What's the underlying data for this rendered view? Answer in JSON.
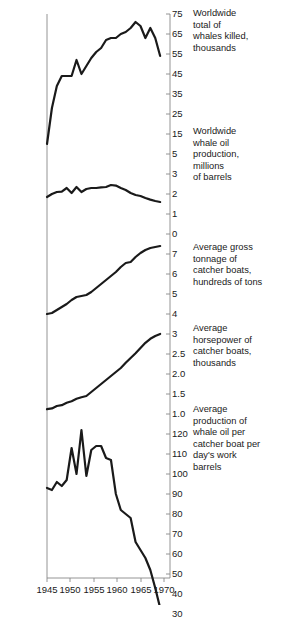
{
  "chart_data": {
    "type": "line",
    "title": "",
    "xlabel": "",
    "ylabel": "",
    "grid": false,
    "legend_position": "right-inline-captions",
    "xlim": [
      1945,
      1970
    ],
    "x_ticks": [
      "1945",
      "1950",
      "1955",
      "1960",
      "1965",
      "1970"
    ],
    "panels": [
      {
        "name": "whales-killed",
        "caption": "Worldwide\ntotal of\nwhales killed,\nthousands",
        "ylabel": "thousands",
        "y_ticks": [
          "75",
          "65",
          "55",
          "45",
          "35",
          "25",
          "15",
          "5"
        ],
        "ylim": [
          5,
          75
        ],
        "x": [
          1945,
          1946,
          1947,
          1948,
          1949,
          1950,
          1951,
          1952,
          1953,
          1954,
          1955,
          1956,
          1957,
          1958,
          1959,
          1960,
          1961,
          1962,
          1963,
          1964,
          1965,
          1966,
          1967,
          1968
        ],
        "values": [
          10,
          28,
          39,
          44,
          44,
          44,
          52,
          45,
          49,
          53,
          56,
          58,
          62,
          63,
          63,
          65,
          66,
          68,
          71,
          69,
          63,
          68,
          63,
          54
        ]
      },
      {
        "name": "whale-oil-production",
        "caption": "Worldwide\nwhale oil\nproduction,\nmillions\nof barrels",
        "ylabel": "millions of barrels",
        "y_ticks": [
          "3",
          "2",
          "1",
          "0"
        ],
        "ylim": [
          0,
          3
        ],
        "x": [
          1945,
          1946,
          1947,
          1948,
          1949,
          1950,
          1951,
          1952,
          1953,
          1954,
          1955,
          1956,
          1957,
          1958,
          1959,
          1960,
          1961,
          1962,
          1963,
          1964,
          1965,
          1966,
          1967,
          1968
        ],
        "values": [
          1.85,
          2.0,
          2.1,
          2.12,
          2.3,
          2.05,
          2.35,
          2.1,
          2.25,
          2.3,
          2.3,
          2.33,
          2.35,
          2.45,
          2.42,
          2.3,
          2.2,
          2.05,
          1.95,
          1.9,
          1.8,
          1.72,
          1.65,
          1.6
        ]
      },
      {
        "name": "gross-tonnage",
        "caption": "Average gross\ntonnage of\ncatcher boats,\nhundreds of tons",
        "ylabel": "hundreds of tons",
        "y_ticks": [
          "7",
          "6",
          "5",
          "4"
        ],
        "ylim": [
          4,
          7.4
        ],
        "x": [
          1945,
          1946,
          1947,
          1948,
          1949,
          1950,
          1951,
          1952,
          1953,
          1954,
          1955,
          1956,
          1957,
          1958,
          1959,
          1960,
          1961,
          1962,
          1963,
          1964,
          1965,
          1966,
          1967,
          1968
        ],
        "values": [
          4.0,
          4.05,
          4.2,
          4.35,
          4.5,
          4.7,
          4.85,
          4.9,
          4.95,
          5.1,
          5.3,
          5.5,
          5.7,
          5.9,
          6.1,
          6.35,
          6.55,
          6.6,
          6.85,
          7.05,
          7.2,
          7.3,
          7.35,
          7.4
        ]
      },
      {
        "name": "horsepower",
        "caption": "Average\nhorsepower of\ncatcher boats,\nthousands",
        "ylabel": "thousands",
        "y_ticks": [
          "3",
          "2.5",
          "2.0",
          "1.5",
          "1.0"
        ],
        "ylim": [
          1.0,
          3.0
        ],
        "x": [
          1945,
          1946,
          1947,
          1948,
          1949,
          1950,
          1951,
          1952,
          1953,
          1954,
          1955,
          1956,
          1957,
          1958,
          1959,
          1960,
          1961,
          1962,
          1963,
          1964,
          1965,
          1966,
          1967,
          1968
        ],
        "values": [
          1.12,
          1.14,
          1.2,
          1.22,
          1.28,
          1.32,
          1.38,
          1.42,
          1.45,
          1.55,
          1.65,
          1.75,
          1.85,
          1.95,
          2.05,
          2.15,
          2.28,
          2.4,
          2.52,
          2.65,
          2.78,
          2.88,
          2.95,
          3.0
        ]
      },
      {
        "name": "production-per-boat-day",
        "caption": "Average\nproduction of\nwhale oil per\ncatcher boat per\nday's work\nbarrels",
        "ylabel": "barrels",
        "y_ticks": [
          "120",
          "110",
          "100",
          "90",
          "80",
          "70",
          "60",
          "50",
          "40",
          "30"
        ],
        "ylim": [
          30,
          125
        ],
        "x": [
          1945,
          1946,
          1947,
          1948,
          1949,
          1950,
          1951,
          1952,
          1953,
          1954,
          1955,
          1956,
          1957,
          1958,
          1959,
          1960,
          1961,
          1962,
          1963,
          1964,
          1965,
          1966,
          1967,
          1968
        ],
        "values": [
          93,
          92,
          96,
          94,
          97,
          113,
          100,
          122,
          99,
          112,
          114,
          114,
          108,
          107,
          90,
          82,
          80,
          78,
          66,
          62,
          58,
          52,
          43,
          33
        ]
      }
    ]
  },
  "axis": {
    "y_tick_labels": [
      {
        "text": "75",
        "y": 14
      },
      {
        "text": "65",
        "y": 34
      },
      {
        "text": "55",
        "y": 54
      },
      {
        "text": "45",
        "y": 74
      },
      {
        "text": "35",
        "y": 94
      },
      {
        "text": "25",
        "y": 114
      },
      {
        "text": "15",
        "y": 134
      },
      {
        "text": "5",
        "y": 154
      },
      {
        "text": "3",
        "y": 174
      },
      {
        "text": "2",
        "y": 194
      },
      {
        "text": "1",
        "y": 214
      },
      {
        "text": "0",
        "y": 234
      },
      {
        "text": "7",
        "y": 254
      },
      {
        "text": "6",
        "y": 274
      },
      {
        "text": "5",
        "y": 294
      },
      {
        "text": "4",
        "y": 314
      },
      {
        "text": "3",
        "y": 334
      },
      {
        "text": "2.5",
        "y": 354
      },
      {
        "text": "2.0",
        "y": 374
      },
      {
        "text": "1.5",
        "y": 394
      },
      {
        "text": "1.0",
        "y": 414
      },
      {
        "text": "120",
        "y": 434
      },
      {
        "text": "110",
        "y": 454
      },
      {
        "text": "100",
        "y": 474
      },
      {
        "text": "90",
        "y": 494
      },
      {
        "text": "80",
        "y": 514
      },
      {
        "text": "70",
        "y": 534
      },
      {
        "text": "60",
        "y": 554
      },
      {
        "text": "50",
        "y": 574
      },
      {
        "text": "40",
        "y": 594
      },
      {
        "text": "30",
        "y": 614
      }
    ],
    "x_tick_labels": [
      {
        "text": "1945",
        "x": 47
      },
      {
        "text": "1950",
        "x": 70
      },
      {
        "text": "1955",
        "x": 94
      },
      {
        "text": "1960",
        "x": 117
      },
      {
        "text": "1965",
        "x": 141
      },
      {
        "text": "1970",
        "x": 164
      }
    ]
  },
  "captions": [
    {
      "name": "caption-whales-killed",
      "text": "Worldwide\ntotal of\nwhales killed,\nthousands",
      "x": 193,
      "y": 8
    },
    {
      "name": "caption-whale-oil",
      "text": "Worldwide\nwhale oil\nproduction,\nmillions\nof barrels",
      "x": 193,
      "y": 126
    },
    {
      "name": "caption-gross-tonnage",
      "text": "Average gross\ntonnage of\ncatcher boats,\nhundreds of tons",
      "x": 193,
      "y": 242
    },
    {
      "name": "caption-horsepower",
      "text": "Average\nhorsepower of\ncatcher boats,\nthousands",
      "x": 193,
      "y": 323
    },
    {
      "name": "caption-production",
      "text": "Average\nproduction of\nwhale oil per\ncatcher boat per\nday's work\nbarrels",
      "x": 193,
      "y": 404
    }
  ],
  "style": {
    "line_color": "#1a1a1a",
    "axis_color": "#888888",
    "background": "#ffffff"
  }
}
